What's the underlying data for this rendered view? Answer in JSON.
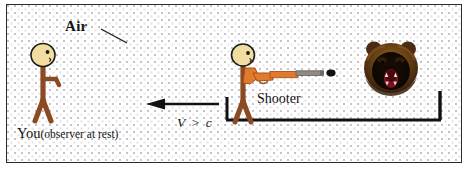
{
  "figure": {
    "background_color": "#ffffff",
    "frame_color": "#2b2b2b",
    "labels": {
      "air": "Air",
      "observer": "You",
      "observer_note": "(observer at rest)",
      "shooter": "Shooter",
      "velocity": "V > c"
    },
    "elements": {
      "observer_figure": "stick-figure-observer",
      "shooter_figure": "stick-figure-shooter",
      "rifle": "rifle",
      "bullet": "bullet",
      "bear": "grizzly-bear-head",
      "platform": "platform-rail",
      "motion_arrow": "leftward-motion-arrow",
      "air_leader_line": "air-leader-line"
    },
    "colors": {
      "skin": "#f2dda0",
      "skin_stroke": "#1a1a1a",
      "body": "#8a4a22",
      "rifle_wood": "#e07b2e",
      "rifle_wood_dark": "#a9501a",
      "rifle_barrel": "#8f8b80",
      "bullet": "#111111",
      "bear_fur": "#4a2a10",
      "bear_fur_light": "#8a5a28",
      "bear_face": "#120a04",
      "bear_mouth": "#7c1020",
      "line": "#111111"
    }
  }
}
